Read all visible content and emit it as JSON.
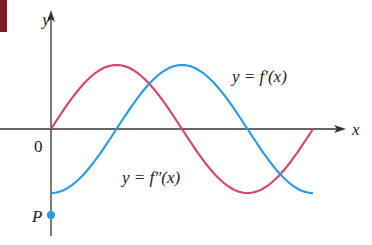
{
  "chart_data": {
    "type": "line",
    "title": "",
    "xlabel": "x",
    "ylabel": "y",
    "origin_label": "0",
    "point_label": "P",
    "grid": false,
    "series": [
      {
        "name": "y = f'(x)",
        "label": "y = f′(x)",
        "color": "#2e9ae0",
        "shape": "-cos",
        "x": [
          0,
          0.25,
          0.5,
          0.75,
          1.0
        ],
        "values": [
          -1,
          0,
          1,
          0,
          -1
        ]
      },
      {
        "name": "y = f''(x)",
        "label": "y = f″(x)",
        "color": "#d4456e",
        "shape": "sin",
        "x": [
          0,
          0.25,
          0.5,
          0.75,
          1.0
        ],
        "values": [
          0,
          1,
          0,
          -1,
          0
        ]
      }
    ],
    "points": [
      {
        "label": "P",
        "x": 0,
        "y": -1.5,
        "color": "#2e9ae0"
      }
    ],
    "annotations": [
      "y = f′(x)",
      "y = f″(x)"
    ]
  },
  "labels": {
    "y_axis": "y",
    "x_axis": "x",
    "origin": "0",
    "point": "P",
    "f_prime": "y = f′(x)",
    "f_double_prime": "y = f″(x)"
  },
  "colors": {
    "f_prime": "#2e9ae0",
    "f_double_prime": "#d4456e",
    "axis": "#333333",
    "corner_marker": "#7a1a2a"
  }
}
